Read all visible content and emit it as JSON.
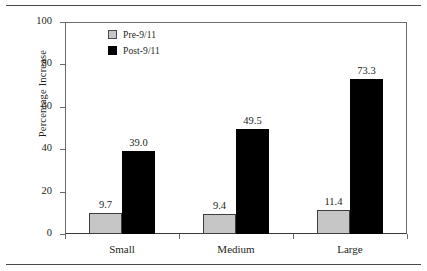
{
  "chart_data": {
    "type": "bar",
    "title": "",
    "subtitle": "",
    "xlabel": "",
    "ylabel": "Percentage Increase",
    "categories": [
      "Small",
      "Medium",
      "Large"
    ],
    "series": [
      {
        "name": "Pre-9/11",
        "values": [
          9.7,
          9.4,
          11.4
        ],
        "color": "#c6c6c6"
      },
      {
        "name": "Post-9/11",
        "values": [
          39.0,
          49.5,
          73.3
        ],
        "color": "#000000"
      }
    ],
    "value_labels": [
      [
        "9.7",
        "39.0"
      ],
      [
        "9.4",
        "49.5"
      ],
      [
        "11.4",
        "73.3"
      ]
    ],
    "ylim": [
      0,
      100
    ],
    "yticks": [
      0,
      20,
      40,
      60,
      80,
      100
    ],
    "ytick_labels": [
      "0",
      "20",
      "40",
      "60",
      "80",
      "100"
    ],
    "grid": false,
    "legend_position": "top-left"
  },
  "legend": {
    "entries": [
      {
        "label": "Pre-9/11",
        "swatch": "gray-swatch"
      },
      {
        "label": "Post-9/11",
        "swatch": "black-swatch"
      }
    ]
  },
  "colors": {
    "pre": "#c6c6c6",
    "post": "#000000",
    "axis": "#6b6b6b",
    "text": "#231f20",
    "rule": "#4a4a4a",
    "background": "#ffffff"
  }
}
